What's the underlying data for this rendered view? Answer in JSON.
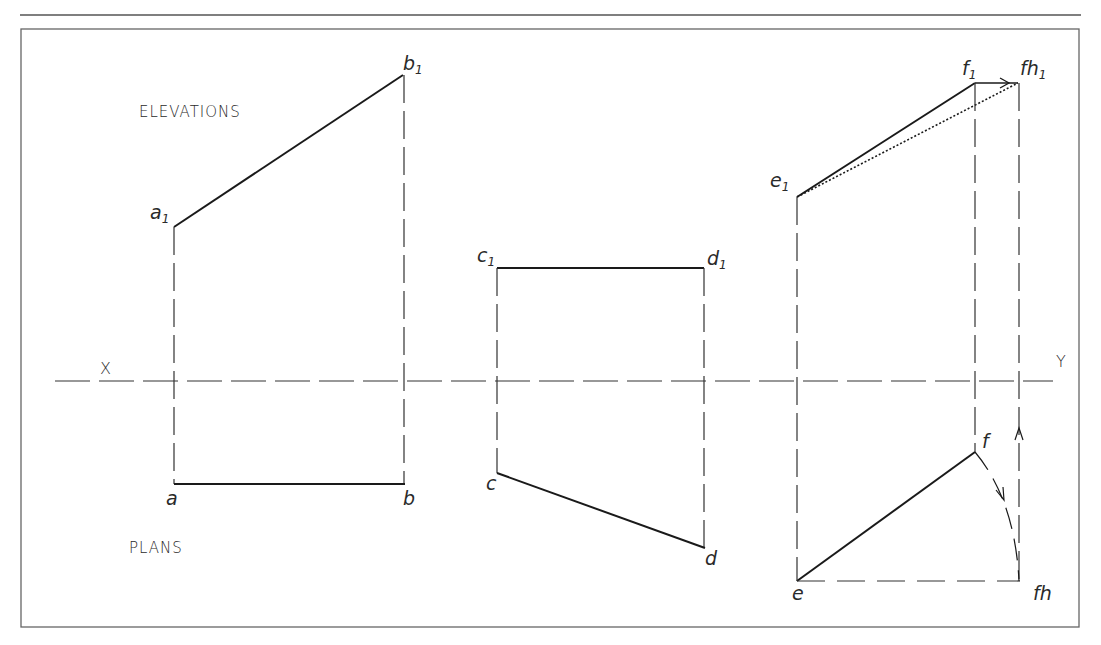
{
  "figure": {
    "type": "orthographic-projection",
    "labels": {
      "elevations": "ELEVATIONS",
      "plans": "PLANS",
      "x_axis": "X",
      "y_axis": "Y"
    },
    "colors": {
      "line": "#1a1a1a",
      "projector": "#333333",
      "frame": "#555555",
      "text": "#2a2a2a"
    },
    "points": {
      "a1": {
        "base": "a",
        "sub": "1"
      },
      "b1": {
        "base": "b",
        "sub": "1"
      },
      "a": {
        "base": "a",
        "sub": ""
      },
      "b": {
        "base": "b",
        "sub": ""
      },
      "c1": {
        "base": "c",
        "sub": "1"
      },
      "d1": {
        "base": "d",
        "sub": "1"
      },
      "c": {
        "base": "c",
        "sub": ""
      },
      "d": {
        "base": "d",
        "sub": ""
      },
      "e1": {
        "base": "e",
        "sub": "1"
      },
      "f1": {
        "base": "f",
        "sub": "1"
      },
      "fh1": {
        "base": "fh",
        "sub": "1"
      },
      "e": {
        "base": "e",
        "sub": ""
      },
      "f": {
        "base": "f",
        "sub": ""
      },
      "fh": {
        "base": "fh",
        "sub": ""
      }
    },
    "cases": [
      {
        "name": "line-ab",
        "description": "Line parallel to HP, inclined to VP"
      },
      {
        "name": "line-cd",
        "description": "Line parallel to VP, inclined to HP"
      },
      {
        "name": "line-ef",
        "description": "Line inclined to both planes, true length by rotation (f to fh, f1 to fh1)"
      }
    ]
  }
}
